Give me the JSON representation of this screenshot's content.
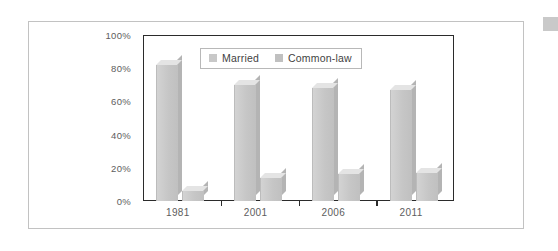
{
  "chart_data": {
    "type": "bar",
    "title": "",
    "subtitle": "",
    "xlabel": "",
    "ylabel": "",
    "categories": [
      "1981",
      "2001",
      "2006",
      "2011"
    ],
    "series": [
      {
        "name": "Married",
        "values": [
          82,
          70,
          68,
          67
        ],
        "color": "#c8c8c8"
      },
      {
        "name": "Common-law",
        "values": [
          6,
          14,
          16,
          17
        ],
        "color": "#c0c0c0"
      }
    ],
    "ylim": [
      0,
      100
    ],
    "y_ticks": [
      {
        "value": 100,
        "label": "100%"
      },
      {
        "value": 80,
        "label": "80%"
      },
      {
        "value": 60,
        "label": "60%"
      },
      {
        "value": 40,
        "label": "40%"
      },
      {
        "value": 20,
        "label": "20%"
      },
      {
        "value": 0,
        "label": "0%"
      }
    ],
    "grid": false,
    "legend_position": "top-center",
    "style": "3d-column",
    "annotations": []
  },
  "figure": {
    "border_color": "#c2c2c2",
    "plot_border_color": "#2b2b2b",
    "background": "#ffffff",
    "tick_label_color": "#5d5d5d",
    "legend_border_color": "#b8b8b8",
    "corner_mark_color": "#c9c9c9"
  },
  "legend": {
    "entries": [
      {
        "label": "Married",
        "swatch": "#c8c8c8"
      },
      {
        "label": "Common-law",
        "swatch": "#c0c0c0"
      }
    ]
  }
}
